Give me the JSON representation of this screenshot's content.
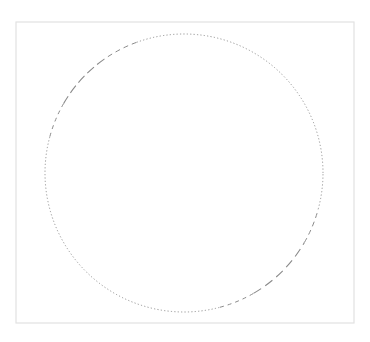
{
  "figure": {
    "width": 370,
    "height": 342,
    "background": "#ffffff",
    "frame": {
      "x": 16,
      "y": 22,
      "width": 338,
      "height": 301,
      "stroke": "#e2e2e2",
      "stroke_width": 1.2
    },
    "circle": {
      "cx": 184,
      "cy": 173,
      "r": 139,
      "stroke": "#8a8a8a",
      "segments": [
        {
          "from_deg": 0,
          "to_deg": 110,
          "style": "dotted",
          "dash": "1.2 2.2",
          "width": 0.9
        },
        {
          "from_deg": 110,
          "to_deg": 125,
          "style": "dashed",
          "dash": "5 4",
          "width": 1.0
        },
        {
          "from_deg": 125,
          "to_deg": 150,
          "style": "dashed",
          "dash": "9 4",
          "width": 1.1
        },
        {
          "from_deg": 150,
          "to_deg": 165,
          "style": "dashed",
          "dash": "4 4",
          "width": 1.0
        },
        {
          "from_deg": 165,
          "to_deg": 285,
          "style": "dotted",
          "dash": "1.2 2.2",
          "width": 0.9
        },
        {
          "from_deg": 285,
          "to_deg": 300,
          "style": "dashed",
          "dash": "4 4",
          "width": 1.0
        },
        {
          "from_deg": 300,
          "to_deg": 330,
          "style": "dashed",
          "dash": "9 5",
          "width": 1.1
        },
        {
          "from_deg": 330,
          "to_deg": 345,
          "style": "dashed",
          "dash": "5 4",
          "width": 1.0
        },
        {
          "from_deg": 345,
          "to_deg": 360,
          "style": "dotted",
          "dash": "1.2 2.2",
          "width": 0.9
        }
      ]
    }
  }
}
